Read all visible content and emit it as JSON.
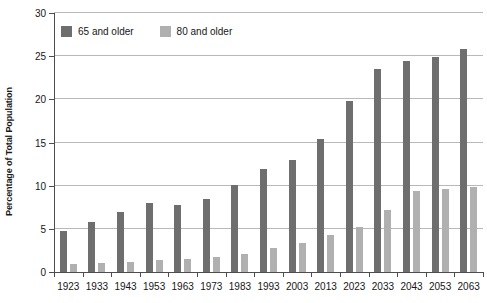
{
  "chart_data": {
    "type": "bar",
    "title": "",
    "xlabel": "",
    "ylabel": "Percentage of Total Population",
    "ylim": [
      0,
      30
    ],
    "yticks": [
      0,
      5,
      10,
      15,
      20,
      25,
      30
    ],
    "grid": true,
    "legend_position": "top-left",
    "categories": [
      "1923",
      "1933",
      "1943",
      "1953",
      "1963",
      "1973",
      "1983",
      "1993",
      "2003",
      "2013",
      "2023",
      "2033",
      "2043",
      "2053",
      "2063"
    ],
    "series": [
      {
        "name": "65 and older",
        "color": "#6e6e6e",
        "values": [
          4.8,
          5.8,
          7.0,
          8.0,
          7.8,
          8.4,
          10.1,
          11.9,
          13.0,
          15.4,
          19.8,
          23.5,
          24.4,
          24.9,
          25.8
        ]
      },
      {
        "name": "80 and older",
        "color": "#b0b0b0",
        "values": [
          0.9,
          1.0,
          1.2,
          1.4,
          1.5,
          1.7,
          2.1,
          2.8,
          3.4,
          4.3,
          5.2,
          7.2,
          9.4,
          9.6,
          9.8
        ]
      }
    ]
  },
  "legend": {
    "items": [
      {
        "label": "65 and older",
        "color": "#6e6e6e",
        "swatch_name": "legend-swatch-65-and-older"
      },
      {
        "label": "80 and older",
        "color": "#b0b0b0",
        "swatch_name": "legend-swatch-80-and-older"
      }
    ]
  },
  "axes": {
    "y_title": "Percentage of Total Population"
  }
}
